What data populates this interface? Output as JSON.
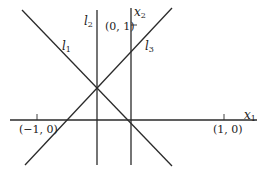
{
  "figure": {
    "stroke_color": "#2a2a2a",
    "axes": {
      "x1": {
        "label": "x",
        "sub": "1"
      },
      "x2": {
        "label": "x",
        "sub": "2"
      }
    },
    "ticks": {
      "neg_one": "(−1, 0)",
      "pos_one": "(1, 0)",
      "x2_one": "(0, 1)"
    },
    "lines": {
      "l1": {
        "label": "l",
        "sub": "1"
      },
      "l2": {
        "label": "l",
        "sub": "2"
      },
      "l3": {
        "label": "l",
        "sub": "3"
      }
    }
  }
}
